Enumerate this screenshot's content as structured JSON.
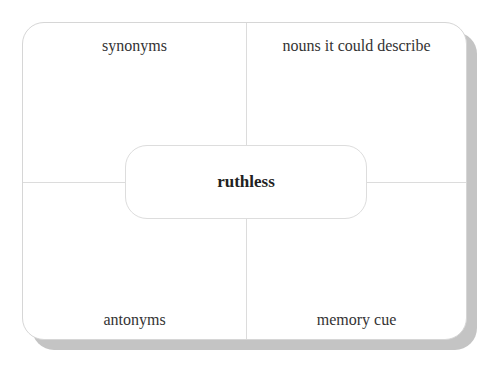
{
  "frayer_model": {
    "center_word": "ruthless",
    "quadrants": {
      "top_left": "synonyms",
      "top_right": "nouns it could describe",
      "bottom_left": "antonyms",
      "bottom_right": "memory cue"
    }
  },
  "colors": {
    "background": "#ffffff",
    "card_border": "#d6d6d6",
    "divider": "#dcdcdc",
    "shadow": "#c4c4c4",
    "label_text": "#333333",
    "center_text": "#222222"
  }
}
